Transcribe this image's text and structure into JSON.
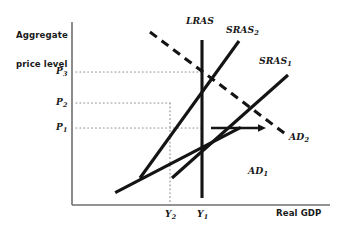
{
  "figure": {
    "type": "economics-diagram",
    "title_visible": false,
    "background_color": "#ffffff",
    "ink_color": "#141414",
    "dotted_guide_color": "#8a8a8a"
  },
  "axes": {
    "y_axis_label_line1": "Aggregate",
    "y_axis_label_line2": "price level",
    "x_axis_label": "Real GDP",
    "y_axis_x_px": 72,
    "x_axis_y_px": 205,
    "x_axis_end_px": 330,
    "y_axis_top_px": 22
  },
  "price_ticks": [
    {
      "name": "P3",
      "label": "P",
      "sub": "3",
      "y_px": 72
    },
    {
      "name": "P2",
      "label": "P",
      "sub": "2",
      "y_px": 103
    },
    {
      "name": "P1",
      "label": "P",
      "sub": "1",
      "y_px": 128
    }
  ],
  "output_ticks": [
    {
      "name": "Y2",
      "label": "Y",
      "sub": "2",
      "x_px": 170
    },
    {
      "name": "Y1",
      "label": "Y",
      "sub": "1",
      "x_px": 202
    }
  ],
  "curves": [
    {
      "id": "LRAS",
      "label": "LRAS",
      "sub": "",
      "style": "solid",
      "orientation": "vertical",
      "x_px": 202,
      "y_top_px": 40,
      "y_bottom_px": 198,
      "label_x_px": 186,
      "label_y_px": 22
    },
    {
      "id": "SRAS2",
      "label": "SRAS",
      "sub": "2",
      "style": "solid",
      "orientation": "upward-sloping",
      "from": [
        140,
        178
      ],
      "to": [
        239,
        41
      ],
      "label_x_px": 226,
      "label_y_px": 31
    },
    {
      "id": "SRAS1",
      "label": "SRAS",
      "sub": "1",
      "style": "solid",
      "orientation": "upward-sloping",
      "from": [
        172,
        178
      ],
      "to": [
        288,
        75
      ],
      "label_x_px": 259,
      "label_y_px": 62
    },
    {
      "id": "AD1",
      "label": "AD",
      "sub": "1",
      "style": "solid",
      "orientation": "downward-sloping",
      "from": [
        108,
        150
      ],
      "to": [
        248,
        170
      ],
      "label_x_px": 249,
      "label_y_px": 171
    },
    {
      "id": "AD2",
      "label": "AD",
      "sub": "2",
      "style": "dashed",
      "orientation": "downward-sloping",
      "from": [
        150,
        32
      ],
      "to": [
        288,
        136
      ],
      "label_x_px": 289,
      "label_y_px": 136
    }
  ],
  "equilibria": [
    {
      "name": "initial-equilibrium",
      "x_px": 202,
      "y_px": 128,
      "price": "P1",
      "output": "Y1"
    },
    {
      "name": "short-run-equilibrium-left",
      "x_px": 170,
      "y_px": 103,
      "price": "P2",
      "output": "Y2"
    },
    {
      "name": "new-long-run-equilibrium",
      "x_px": 203,
      "y_px": 72,
      "price": "P3",
      "output": "Y1"
    },
    {
      "name": "sras1-ad2-crossing",
      "x_px": 237,
      "y_px": 103,
      "price": "",
      "output": ""
    }
  ],
  "shift_arrow": {
    "name": "ad-shift-arrow",
    "from_x_px": 211,
    "to_x_px": 266,
    "y_px": 128,
    "direction": "right"
  },
  "guide_lines": [
    {
      "name": "p3-guide",
      "type": "horizontal-dotted",
      "y_px": 72,
      "from_x_px": 76,
      "to_x_px": 203
    },
    {
      "name": "p2-guide",
      "type": "horizontal-dotted",
      "y_px": 103,
      "from_x_px": 76,
      "to_x_px": 170
    },
    {
      "name": "p1-guide",
      "type": "horizontal-dotted",
      "y_px": 128,
      "from_x_px": 76,
      "to_x_px": 202
    },
    {
      "name": "y2-guide",
      "type": "vertical-dotted",
      "x_px": 170,
      "from_y_px": 103,
      "to_y_px": 205
    }
  ]
}
